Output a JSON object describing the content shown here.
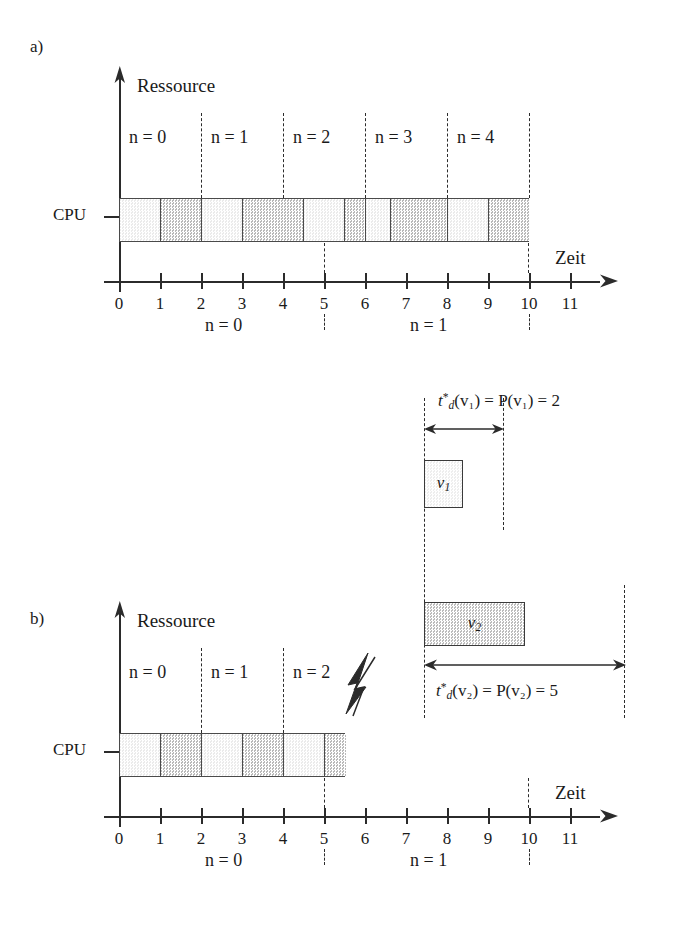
{
  "figure": {
    "panel_a_letter": "a)",
    "panel_b_letter": "b)",
    "resource_axis_label": "Ressource",
    "time_axis_label": "Zeit",
    "resource_row_label": "CPU"
  },
  "axis": {
    "tick_labels": [
      "0",
      "1",
      "2",
      "3",
      "4",
      "5",
      "6",
      "7",
      "8",
      "9",
      "10",
      "11"
    ],
    "x_min": 0,
    "x_max": 11
  },
  "panel_a": {
    "window_labels": [
      {
        "text": "n = 0",
        "start": 0,
        "end": 2
      },
      {
        "text": "n = 1",
        "start": 2,
        "end": 4
      },
      {
        "text": "n = 2",
        "start": 4,
        "end": 6
      },
      {
        "text": "n = 3",
        "start": 6,
        "end": 8
      },
      {
        "text": "n = 4",
        "start": 8,
        "end": 10
      }
    ],
    "window_dividers": [
      2,
      4,
      6,
      8,
      10
    ],
    "cpu_cells": [
      {
        "start": 0,
        "end": 1,
        "shade": "light"
      },
      {
        "start": 1,
        "end": 2,
        "shade": "dark"
      },
      {
        "start": 2,
        "end": 3,
        "shade": "light"
      },
      {
        "start": 3,
        "end": 4.5,
        "shade": "dark"
      },
      {
        "start": 4.5,
        "end": 5.5,
        "shade": "light"
      },
      {
        "start": 5.5,
        "end": 6,
        "shade": "dark"
      },
      {
        "start": 6,
        "end": 6.6,
        "shade": "light"
      },
      {
        "start": 6.6,
        "end": 8,
        "shade": "dark"
      },
      {
        "start": 8,
        "end": 9,
        "shade": "light"
      },
      {
        "start": 9,
        "end": 10,
        "shade": "dark"
      }
    ],
    "cpu_bar_start": 0,
    "cpu_bar_end": 10,
    "below_axis_labels": [
      {
        "text": "n = 0",
        "at": 2.6
      },
      {
        "text": "n = 1",
        "at": 7.6
      }
    ],
    "below_axis_dashes": [
      5,
      10
    ]
  },
  "panel_b": {
    "window_labels": [
      {
        "text": "n = 0",
        "start": 0,
        "end": 2
      },
      {
        "text": "n = 1",
        "start": 2,
        "end": 4
      },
      {
        "text": "n = 2",
        "start": 4,
        "end": 6
      }
    ],
    "window_dividers": [
      2,
      4
    ],
    "lightning_icon": "lightning-bolt-icon",
    "cpu_cells": [
      {
        "start": 0,
        "end": 1,
        "shade": "light"
      },
      {
        "start": 1,
        "end": 2,
        "shade": "dark"
      },
      {
        "start": 2,
        "end": 3,
        "shade": "light"
      },
      {
        "start": 3,
        "end": 4,
        "shade": "dark"
      },
      {
        "start": 4,
        "end": 5,
        "shade": "light"
      },
      {
        "start": 5,
        "end": 5.5,
        "shade": "dark"
      }
    ],
    "cpu_bar_start": 0,
    "cpu_bar_end": 5.5,
    "below_axis_labels": [
      {
        "text": "n = 0",
        "at": 2.6
      },
      {
        "text": "n = 1",
        "at": 7.6
      }
    ],
    "below_axis_dashes": [
      5,
      10
    ]
  },
  "tasks": {
    "v1": {
      "name": "v",
      "sub": "1",
      "box_start": 7.5,
      "box_end": 8.4,
      "formula_lhs": "t",
      "formula_sub": "d",
      "formula_sup": "*",
      "formula_text": "(v₁) = P(v₁) = 2",
      "duration": 2,
      "arrow_start": 7.5,
      "arrow_end": 9.5,
      "shade": "light"
    },
    "v2": {
      "name": "v",
      "sub": "2",
      "box_start": 7.5,
      "box_end": 9.95,
      "formula_lhs": "t",
      "formula_sub": "d",
      "formula_sup": "*",
      "formula_text": "(v₂) = P(v₂) = 5",
      "duration": 5,
      "arrow_start": 7.5,
      "arrow_end": 12.45,
      "shade": "dark"
    },
    "guide_lines": [
      7.5,
      9.5,
      12.45
    ]
  },
  "colors": {
    "ink": "#2b2b2b",
    "cell_light": "#f0f0f0",
    "cell_dark": "#c4c4c4",
    "background": "#ffffff"
  }
}
